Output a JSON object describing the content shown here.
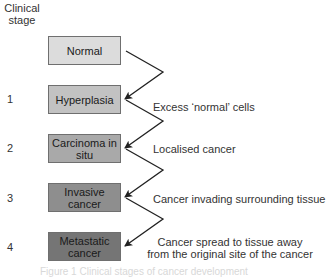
{
  "header": {
    "line1": "Clinical",
    "line2": "stage"
  },
  "stages": [
    {
      "number": "",
      "label_line1": "Normal",
      "label_line2": "",
      "description_line1": "",
      "description_line2": "",
      "fill": "#dcdcdc"
    },
    {
      "number": "1",
      "label_line1": "Hyperplasia",
      "label_line2": "",
      "description_line1": "Excess ‘normal’ cells",
      "description_line2": "",
      "fill": "#c2c2c2"
    },
    {
      "number": "2",
      "label_line1": "Carcinoma in",
      "label_line2": "situ",
      "description_line1": "Localised cancer",
      "description_line2": "",
      "fill": "#a9a9a9"
    },
    {
      "number": "3",
      "label_line1": "Invasive",
      "label_line2": "cancer",
      "description_line1": "Cancer invading surrounding tissue",
      "description_line2": "",
      "fill": "#8e8e8e"
    },
    {
      "number": "4",
      "label_line1": "Metastatic",
      "label_line2": "cancer",
      "description_line1": "Cancer spread to tissue away",
      "description_line2": "from the original site of the cancer",
      "fill": "#757575"
    }
  ],
  "caption": "Figure 1  Clinical stages of cancer development"
}
